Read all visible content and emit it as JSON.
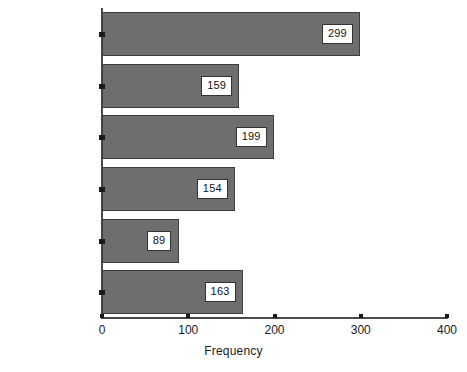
{
  "chart_data": {
    "type": "bar",
    "orientation": "horizontal",
    "title": "",
    "xlabel": "Frequency",
    "ylabel": "",
    "xlim": [
      0,
      400
    ],
    "xticks": [
      0,
      100,
      200,
      300,
      400
    ],
    "grid": false,
    "legend": null,
    "bar_color": "#6e6e6e",
    "bar_edge_color": "#3c3c3c",
    "background_color": "#ffffff",
    "axis_color": "#4a4a4a",
    "categories": [
      "Freedom",
      "Unity with my self",
      "Unity with nature",
      "Luck",
      "Adventure",
      "Happiness"
    ],
    "values": [
      299,
      159,
      199,
      154,
      89,
      163
    ],
    "data_labels": [
      "299",
      "159",
      "199",
      "154",
      "89",
      "163"
    ]
  }
}
